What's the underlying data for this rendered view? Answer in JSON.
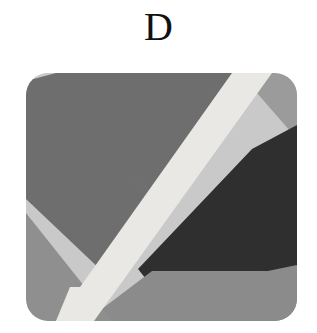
{
  "figure": {
    "label": "D",
    "panel": {
      "x": 26,
      "y": 73,
      "width": 271,
      "height": 248,
      "corner_radius": 22
    },
    "background_color": "#ffffff",
    "label_color": "#111111"
  },
  "artwork": {
    "description": "abstract geometric composition of flat gray polygons",
    "palette": {
      "light_gray": "#c9c9c9",
      "near_white_band": "#e9e8e4",
      "slate_gray": "#6e6e6e",
      "medium_gray": "#9b9b9b",
      "mid_dark_gray": "#8b8b8b",
      "bottom_gray": "#8f8f8f",
      "dark_charcoal": "#2f2f2f",
      "very_dark": "#262626"
    },
    "shapes": [
      {
        "name": "left-light-field",
        "fill": "#c9c9c9",
        "points": "0,0 40,0 0,248"
      },
      {
        "name": "upper-slate-wedge",
        "fill": "#6e6e6e",
        "points": "34,0 202,0 150,104 126,130 0,6 0,0"
      },
      {
        "name": "top-right-medium-wedge",
        "fill": "#9b9b9b",
        "points": "202,0 271,0 271,52 218,14"
      },
      {
        "name": "right-dark-field",
        "fill": "#2f2f2f",
        "points": "271,40 271,206 232,206 232,248 160,248 118,196 214,76"
      },
      {
        "name": "bright-diagonal-band",
        "fill": "#e9e8e4",
        "points": "210,0 248,0 66,248 26,248"
      },
      {
        "name": "lower-left-gray-triangle",
        "fill": "#8f8f8f",
        "points": "0,150 96,248 0,248"
      },
      {
        "name": "bottom-strip",
        "fill": "#8b8b8b",
        "points": "60,248 271,248 271,196 128,196"
      },
      {
        "name": "bottom-right-notch",
        "fill": "#8b8b8b",
        "points": "232,200 271,194 271,248 226,248"
      },
      {
        "name": "center-slate-fill",
        "fill": "#6e6e6e",
        "points": "0,10 126,134 60,248 0,200"
      }
    ]
  }
}
